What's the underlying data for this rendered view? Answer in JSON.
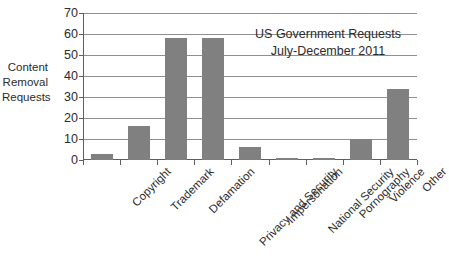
{
  "chart_data": {
    "type": "bar",
    "title": "US Government Requests",
    "subtitle": "July-December 2011",
    "xlabel": "",
    "ylabel": "Content Removal Requests",
    "ylabel_lines": [
      "Content",
      "Removal",
      "Requests"
    ],
    "categories": [
      "Copyright",
      "Trademark",
      "Defamation",
      "Privacy and Security",
      "Impersonation",
      "National Security",
      "Pornography",
      "Violence",
      "Other"
    ],
    "values": [
      3,
      16,
      58,
      58,
      6,
      1,
      1,
      10,
      34
    ],
    "ylim": [
      0,
      70
    ],
    "ytick_step": 10,
    "yticks": [
      0,
      10,
      20,
      30,
      40,
      50,
      60,
      70
    ],
    "ytick_labels": [
      "0",
      "10",
      "20",
      "30",
      "40",
      "50",
      "60",
      "70"
    ],
    "grid": true,
    "grid_axis": "y",
    "legend": false,
    "legend_position": "none",
    "bar_color": "#808080",
    "axis_color": "#5e5e5e",
    "grid_color": "#8f8f8f",
    "background_color": "#ffffff",
    "title_position": "inside-top-right"
  }
}
